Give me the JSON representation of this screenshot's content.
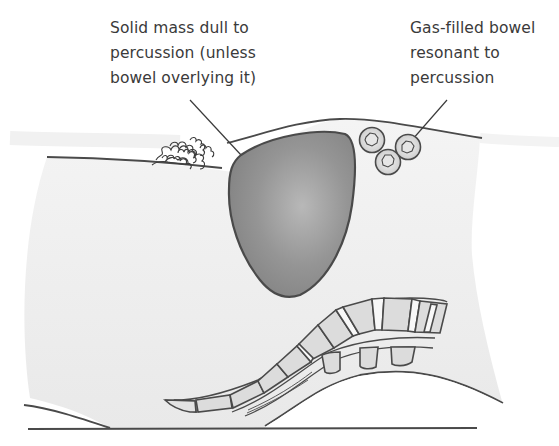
{
  "figure": {
    "labels": {
      "solid_mass": {
        "lines": [
          "Solid mass dull to",
          "percussion (unless",
          "bowel overlying it)"
        ]
      },
      "gas_bowel": {
        "lines": [
          "Gas-filled bowel",
          "resonant to",
          "percussion"
        ]
      }
    },
    "elements": [
      "body-wall-section",
      "pubic-hair",
      "solid-mass",
      "gas-filled-bowel-loops",
      "spine-vertebrae",
      "ground-line"
    ],
    "colors": {
      "background": "#ffffff",
      "body_fill": "#ebebeb",
      "outline": "#4a4a4a",
      "mass_fill": "#8c8c8c",
      "mass_highlight": "#b4b4b4",
      "vertebra_fill": "#dcdcdc",
      "disc_fill": "#f7f7f7",
      "text": "#3a3a3a"
    }
  }
}
